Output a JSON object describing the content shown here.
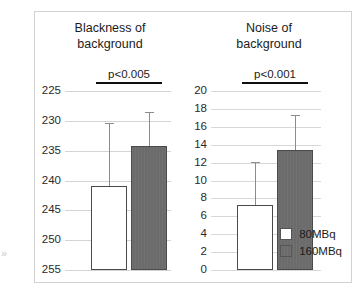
{
  "figure": {
    "edge_artifact": "»",
    "legend": {
      "entries": [
        {
          "label": "80MBq",
          "color": "#ffffff",
          "style": "light"
        },
        {
          "label": "160MBq",
          "color": "#6b6b6b",
          "style": "dark"
        }
      ]
    }
  },
  "chart_data": [
    {
      "type": "bar",
      "panel": "left",
      "title": "Blackness of\nbackground",
      "title_line1": "Blackness of",
      "title_line2": "background",
      "annotation": "p<0.005",
      "categories": [
        "80MBq",
        "160MBq"
      ],
      "values": [
        241.0,
        234.2
      ],
      "errors_upper": [
        230.3,
        228.5
      ],
      "series": [
        {
          "name": "80MBq",
          "value": 241.0,
          "error_upper": 230.3,
          "color": "#ffffff"
        },
        {
          "name": "160MBq",
          "value": 234.2,
          "error_upper": 228.5,
          "color": "#6b6b6b"
        }
      ],
      "xlabel": "",
      "ylabel": "",
      "ylim": [
        225,
        255
      ],
      "y_inverted": true,
      "ytick_step": 5,
      "yticks": [
        225,
        230,
        235,
        240,
        245,
        250,
        255
      ],
      "grid": true,
      "legend_position": "bottom-right"
    },
    {
      "type": "bar",
      "panel": "right",
      "title": "Noise of\nbackground",
      "title_line1": "Noise of",
      "title_line2": "background",
      "annotation": "p<0.001",
      "categories": [
        "80MBq",
        "160MBq"
      ],
      "values": [
        7.3,
        13.4
      ],
      "errors_upper": [
        12.1,
        17.3
      ],
      "series": [
        {
          "name": "80MBq",
          "value": 7.3,
          "error_upper": 12.1,
          "color": "#ffffff"
        },
        {
          "name": "160MBq",
          "value": 13.4,
          "error_upper": 17.3,
          "color": "#6b6b6b"
        }
      ],
      "xlabel": "",
      "ylabel": "",
      "ylim": [
        0,
        20
      ],
      "y_inverted": false,
      "ytick_step": 2,
      "yticks": [
        0,
        2,
        4,
        6,
        8,
        10,
        12,
        14,
        16,
        18,
        20
      ],
      "grid": true,
      "legend_position": "bottom-right"
    }
  ]
}
